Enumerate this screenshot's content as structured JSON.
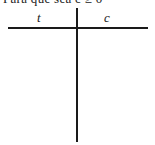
{
  "caption": "Para que sea c ≥ 0",
  "table": {
    "columns": [
      "t",
      "c"
    ],
    "rows": []
  }
}
